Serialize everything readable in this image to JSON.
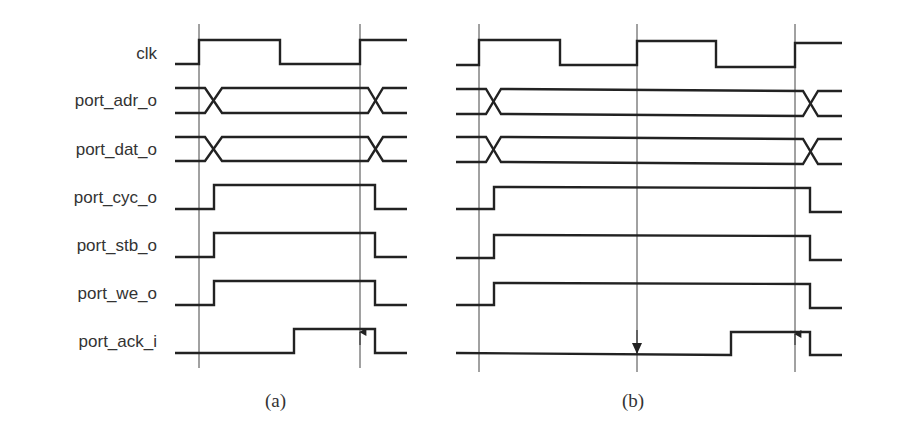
{
  "figure": {
    "signals": [
      {
        "name": "clk",
        "y_high": 40,
        "y_low": 64
      },
      {
        "name": "port_adr_o",
        "y_high": 88,
        "y_low": 113
      },
      {
        "name": "port_dat_o",
        "y_high": 137,
        "y_low": 161
      },
      {
        "name": "port_cyc_o",
        "y_high": 185,
        "y_low": 209
      },
      {
        "name": "port_stb_o",
        "y_high": 233,
        "y_low": 257
      },
      {
        "name": "port_we_o",
        "y_high": 281,
        "y_low": 305
      },
      {
        "name": "port_ack_i",
        "y_high": 329,
        "y_low": 353
      }
    ],
    "panels": [
      {
        "caption": "(a)",
        "description": "Single-cycle write: cyc/stb/we asserted after first clk edge, ack returns, terminates at second rising edge (up arrow)."
      },
      {
        "caption": "(b)",
        "description": "Two-cycle write with wait state: ack low at middle edge (down arrow), ack high at third rising edge (up arrow)."
      }
    ],
    "colors": {
      "waveform": "#222222",
      "marker": "#444444",
      "label": "#333333"
    }
  }
}
